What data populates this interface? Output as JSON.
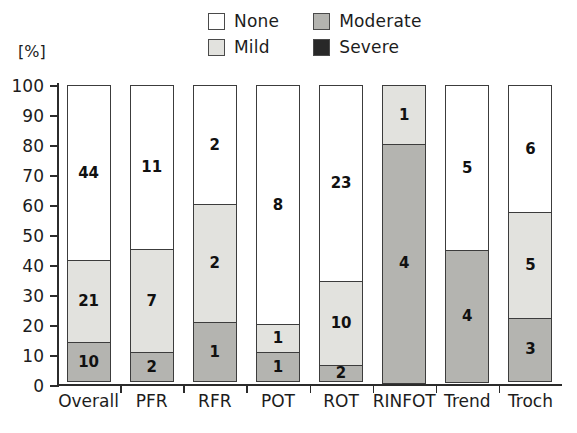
{
  "chart_data": {
    "type": "bar",
    "subtype": "stacked-100-percent",
    "title": "",
    "xlabel": "",
    "ylabel": "[%]",
    "ylim": [
      0,
      100
    ],
    "yticks": [
      0,
      10,
      20,
      30,
      40,
      50,
      60,
      70,
      80,
      90,
      100
    ],
    "grid": false,
    "legend_position": "top-center",
    "categories": [
      "Overall",
      "PFR",
      "RFR",
      "POT",
      "ROT",
      "RINFOT",
      "Trend",
      "Troch"
    ],
    "series": [
      {
        "name": "None",
        "color": "#ffffff",
        "values": [
          44,
          11,
          2,
          8,
          23,
          0,
          5,
          6
        ]
      },
      {
        "name": "Mild",
        "color": "#e2e2de",
        "values": [
          21,
          7,
          2,
          1,
          10,
          1,
          0,
          5
        ]
      },
      {
        "name": "Moderate",
        "color": "#b4b4b0",
        "values": [
          10,
          2,
          1,
          1,
          2,
          4,
          4,
          3
        ]
      },
      {
        "name": "Severe",
        "color": "#282828",
        "values": [
          0,
          0,
          0,
          0,
          0,
          0,
          0,
          0
        ]
      }
    ],
    "percent_segments": [
      {
        "category": "Overall",
        "none": 58.7,
        "mild": 28.0,
        "moderate": 13.3,
        "severe": 0
      },
      {
        "category": "PFR",
        "none": 55.0,
        "mild": 35.0,
        "moderate": 10.0,
        "severe": 0
      },
      {
        "category": "RFR",
        "none": 40.0,
        "mild": 40.0,
        "moderate": 20.0,
        "severe": 0
      },
      {
        "category": "POT",
        "none": 80.0,
        "mild": 10.0,
        "moderate": 10.0,
        "severe": 0
      },
      {
        "category": "ROT",
        "none": 65.7,
        "mild": 28.6,
        "moderate": 5.7,
        "severe": 0
      },
      {
        "category": "RINFOT",
        "none": 0,
        "mild": 20.0,
        "moderate": 80.0,
        "severe": 0
      },
      {
        "category": "Trend",
        "none": 55.6,
        "mild": 0,
        "moderate": 44.4,
        "severe": 0
      },
      {
        "category": "Troch",
        "none": 42.9,
        "mild": 35.7,
        "moderate": 21.4,
        "severe": 0
      }
    ]
  },
  "legend": {
    "items": [
      {
        "label": "None",
        "color": "#ffffff"
      },
      {
        "label": "Moderate",
        "color": "#b4b4b0"
      },
      {
        "label": "Mild",
        "color": "#e2e2de"
      },
      {
        "label": "Severe",
        "color": "#282828"
      }
    ]
  },
  "axis": {
    "unit_label": "[%]",
    "y_tick_labels": [
      "100",
      "90",
      "80",
      "70",
      "60",
      "50",
      "40",
      "30",
      "20",
      "10",
      "0"
    ],
    "x_tick_labels": [
      "Overall",
      "PFR",
      "RFR",
      "POT",
      "ROT",
      "RINFOT",
      "Trend",
      "Troch"
    ]
  }
}
